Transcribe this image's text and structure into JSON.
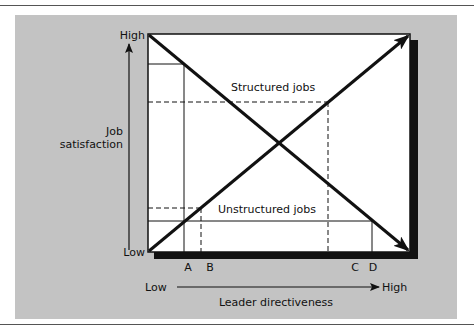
{
  "diagram": {
    "y_axis": {
      "title_line1": "Job",
      "title_line2": "satisfaction",
      "high_label": "High",
      "low_label": "Low"
    },
    "x_axis": {
      "title": "Leader directiveness",
      "low_label": "Low",
      "high_label": "High"
    },
    "series": [
      {
        "name": "Structured jobs",
        "label": "Structured jobs",
        "direction": "decreasing"
      },
      {
        "name": "Unstructured jobs",
        "label": "Unstructured jobs",
        "direction": "increasing"
      }
    ],
    "points": {
      "A": "A",
      "B": "B",
      "C": "C",
      "D": "D"
    },
    "colors": {
      "panel": "#c3c3c3",
      "plot_bg": "#ffffff",
      "line": "#111111"
    }
  }
}
